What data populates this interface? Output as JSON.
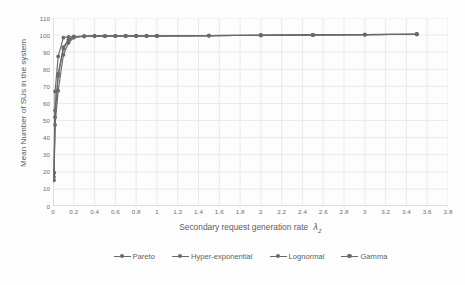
{
  "chart_data": {
    "type": "line",
    "title": "",
    "xlabel": "Secondary request generation rate",
    "xlabel_symbol": "λ",
    "xlabel_symbol_sub": "2",
    "ylabel": "Mean Number of SUs in the system",
    "xlim": [
      0,
      3.8
    ],
    "ylim": [
      0,
      110
    ],
    "xticks": [
      "0",
      "0.2",
      "0.4",
      "0.6",
      "0.8",
      "1",
      "1.2",
      "1.4",
      "1.6",
      "1.8",
      "2",
      "2.2",
      "2.4",
      "2.6",
      "2.8",
      "3",
      "3.2",
      "3.4",
      "3.6",
      "3.8"
    ],
    "xtick_values": [
      0,
      0.2,
      0.4,
      0.6,
      0.8,
      1,
      1.2,
      1.4,
      1.6,
      1.8,
      2,
      2.2,
      2.4,
      2.6,
      2.8,
      3,
      3.2,
      3.4,
      3.6,
      3.8
    ],
    "yticks": [
      "0",
      "10",
      "20",
      "30",
      "40",
      "50",
      "60",
      "70",
      "80",
      "90",
      "100",
      "110"
    ],
    "ytick_values": [
      0,
      10,
      20,
      30,
      40,
      50,
      60,
      70,
      80,
      90,
      100,
      110
    ],
    "grid": true,
    "legend_position": "bottom",
    "series_color": "#6a6a6a",
    "grid_color": "#e3e3e3",
    "axis_color": "#c9c9c9",
    "series": [
      {
        "name": "Pareto",
        "x": [
          0.01,
          0.02,
          0.05,
          0.1,
          0.15,
          0.2,
          0.3,
          0.4,
          0.5,
          0.6,
          0.7,
          0.8,
          0.9,
          1.0,
          1.5,
          2.0,
          2.5,
          3.0,
          3.5
        ],
        "values": [
          19.5,
          67.0,
          87.5,
          98.5,
          99.0,
          99.2,
          99.4,
          99.4,
          99.4,
          99.4,
          99.5,
          99.5,
          99.5,
          99.5,
          99.7,
          99.9,
          100.1,
          100.3,
          100.5
        ]
      },
      {
        "name": "Hyper-exponential",
        "x": [
          0.01,
          0.02,
          0.05,
          0.1,
          0.15,
          0.2,
          0.3,
          0.4,
          0.5,
          0.6,
          0.7,
          0.8,
          0.9,
          1.0,
          1.5,
          2.0,
          2.5,
          3.0,
          3.5
        ],
        "values": [
          17.0,
          56.0,
          77.5,
          93.0,
          97.5,
          99.0,
          99.3,
          99.4,
          99.4,
          99.4,
          99.5,
          99.5,
          99.5,
          99.5,
          99.7,
          99.9,
          100.1,
          100.3,
          100.5
        ]
      },
      {
        "name": "Lognormal",
        "x": [
          0.01,
          0.02,
          0.05,
          0.1,
          0.15,
          0.2,
          0.3,
          0.4,
          0.5,
          0.6,
          0.7,
          0.8,
          0.9,
          1.0,
          1.5,
          2.0,
          2.5,
          3.0,
          3.5
        ],
        "values": [
          19.5,
          52.0,
          76.0,
          92.0,
          97.0,
          98.8,
          99.3,
          99.4,
          99.4,
          99.4,
          99.5,
          99.5,
          99.5,
          99.5,
          99.7,
          99.9,
          100.1,
          100.3,
          100.5
        ]
      },
      {
        "name": "Gamma",
        "x": [
          0.01,
          0.02,
          0.05,
          0.1,
          0.15,
          0.2,
          0.3,
          0.4,
          0.5,
          0.6,
          0.7,
          0.8,
          0.9,
          1.0,
          1.5,
          2.0,
          2.5,
          3.0,
          3.5
        ],
        "values": [
          15.0,
          47.5,
          67.5,
          88.5,
          95.5,
          98.5,
          99.3,
          99.4,
          99.4,
          99.4,
          99.5,
          99.5,
          99.5,
          99.5,
          99.7,
          99.9,
          100.1,
          100.3,
          100.5
        ]
      }
    ],
    "legend": [
      "Pareto",
      "Hyper-exponential",
      "Lognormal",
      "Gamma"
    ]
  }
}
